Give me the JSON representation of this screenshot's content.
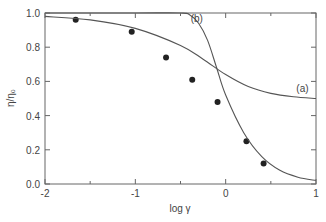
{
  "chart_data": {
    "type": "scatter",
    "title": "",
    "xlabel": "log γ",
    "ylabel": "η/η₀",
    "xlim": [
      -2,
      1
    ],
    "ylim": [
      0,
      1.0
    ],
    "x_ticks": [
      "-2",
      "-1",
      "0",
      "1"
    ],
    "y_ticks": [
      "0.0",
      "0.2",
      "0.4",
      "0.6",
      "0.8",
      "1.0"
    ],
    "grid": false,
    "series": [
      {
        "name": "data",
        "kind": "points",
        "x": [
          -1.66,
          -1.04,
          -0.66,
          -0.37,
          -0.09,
          0.23,
          0.42
        ],
        "y": [
          0.96,
          0.89,
          0.74,
          0.61,
          0.48,
          0.25,
          0.12
        ]
      },
      {
        "name": "(a)",
        "kind": "line",
        "x": [
          -2.0,
          -1.5,
          -1.0,
          -0.5,
          -0.25,
          0.0,
          0.25,
          0.5,
          0.75,
          1.0
        ],
        "y": [
          0.98,
          0.96,
          0.91,
          0.81,
          0.73,
          0.64,
          0.57,
          0.53,
          0.51,
          0.5
        ]
      },
      {
        "name": "(b)",
        "kind": "line",
        "x": [
          -2.0,
          -1.0,
          -0.5,
          -0.4,
          -0.3,
          -0.2,
          -0.1,
          0.0,
          0.2,
          0.4,
          0.6,
          0.8,
          1.0
        ],
        "y": [
          1.0,
          1.0,
          1.0,
          0.99,
          0.94,
          0.84,
          0.68,
          0.52,
          0.3,
          0.16,
          0.08,
          0.04,
          0.02
        ]
      }
    ],
    "annotations": [
      {
        "text": "(a)",
        "x": 0.85,
        "y": 0.54
      },
      {
        "text": "(b)",
        "x": -0.32,
        "y": 0.95
      }
    ]
  }
}
